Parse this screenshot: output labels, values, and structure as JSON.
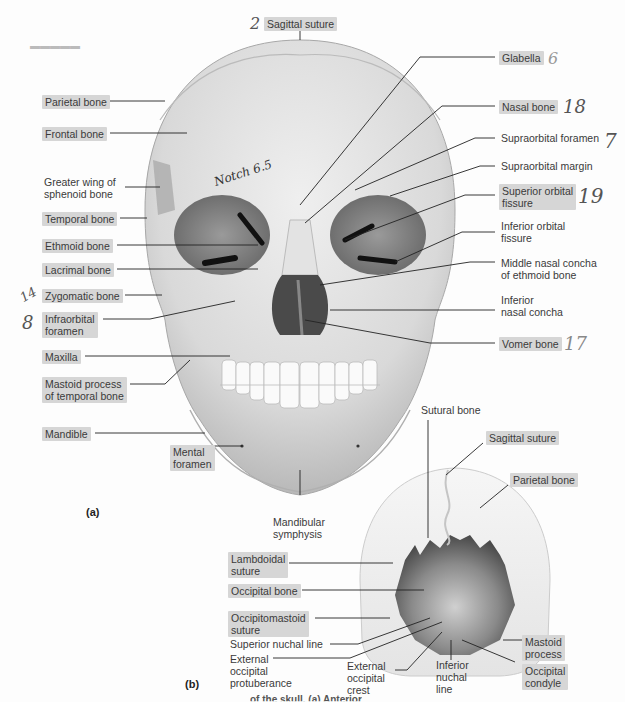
{
  "figure": {
    "panel_a": {
      "tag": "(a)",
      "labels_left": [
        {
          "text": "Parietal bone",
          "highlighted": true
        },
        {
          "text": "Frontal bone",
          "highlighted": true
        },
        {
          "text": "Greater wing of\nsphenoid bone",
          "line1": "Greater wing of",
          "line2": "sphenoid bone",
          "highlighted": false
        },
        {
          "text": "Temporal bone",
          "highlighted": true
        },
        {
          "text": "Ethmoid bone",
          "highlighted": true
        },
        {
          "text": "Lacrimal bone",
          "highlighted": true
        },
        {
          "text": "Zygomatic bone",
          "highlighted": true
        },
        {
          "text": "Infraorbital foramen",
          "line1": "Infraorbital",
          "line2": "foramen",
          "highlighted": true
        },
        {
          "text": "Maxilla",
          "highlighted": true
        },
        {
          "text": "Mastoid process of temporal bone",
          "line1": "Mastoid process",
          "line2": "of temporal bone",
          "highlighted": true
        },
        {
          "text": "Mandible",
          "highlighted": true
        },
        {
          "text": "Mental foramen",
          "line1": "Mental",
          "line2": "foramen",
          "highlighted": true
        }
      ],
      "labels_top": [
        {
          "text": "Sagittal suture",
          "highlighted": true
        }
      ],
      "labels_right": [
        {
          "text": "Glabella",
          "highlighted": true
        },
        {
          "text": "Nasal bone",
          "highlighted": true
        },
        {
          "text": "Supraorbital foramen",
          "highlighted": false
        },
        {
          "text": "Supraorbital margin",
          "highlighted": false
        },
        {
          "text": "Superior orbital fissure",
          "line1": "Superior orbital",
          "line2": "fissure",
          "highlighted": true
        },
        {
          "text": "Inferior orbital fissure",
          "line1": "Inferior orbital",
          "line2": "fissure",
          "highlighted": false
        },
        {
          "text": "Middle nasal concha of ethmoid bone",
          "line1": "Middle nasal concha",
          "line2": "of ethmoid bone",
          "highlighted": false
        },
        {
          "text": "Inferior nasal concha",
          "line1": "Inferior",
          "line2": "nasal concha",
          "highlighted": false
        },
        {
          "text": "Vomer bone",
          "highlighted": true
        }
      ],
      "labels_bottom": [
        {
          "text": "Mandibular symphysis",
          "line1": "Mandibular",
          "line2": "symphysis"
        }
      ]
    },
    "panel_b": {
      "tag": "(b)",
      "labels": [
        {
          "text": "Sutural bone",
          "highlighted": false
        },
        {
          "text": "Sagittal suture",
          "highlighted": true
        },
        {
          "text": "Parietal bone",
          "highlighted": true
        },
        {
          "text": "Lambdoidal suture",
          "line1": "Lambdoidal",
          "line2": "suture",
          "highlighted": true
        },
        {
          "text": "Occipital bone",
          "highlighted": true
        },
        {
          "text": "Occipitomastoid suture",
          "line1": "Occipitomastoid",
          "line2": "suture",
          "highlighted": true
        },
        {
          "text": "Superior nuchal line",
          "highlighted": false
        },
        {
          "text": "External occipital protuberance",
          "line1": "External",
          "line2": "occipital",
          "line3": "protuberance",
          "highlighted": false
        },
        {
          "text": "External occipital crest",
          "line1": "External",
          "line2": "occipital",
          "line3": "crest",
          "highlighted": false
        },
        {
          "text": "Inferior nuchal line",
          "line1": "Inferior",
          "line2": "nuchal",
          "line3": "line",
          "highlighted": false
        },
        {
          "text": "Mastoid process",
          "line1": "Mastoid",
          "line2": "process",
          "highlighted": true
        },
        {
          "text": "Occipital condyle",
          "line1": "Occipital",
          "line2": "condyle",
          "highlighted": true
        }
      ]
    },
    "handwritten": {
      "sagittal": "2",
      "glabella": "6",
      "nasal": "18",
      "supraorbital_foramen": "7",
      "superior_orbital": "19",
      "vomer": "17",
      "zygomatic": "14",
      "infraorbital": "8",
      "notch": "Notch 6.5"
    },
    "caption_fragment": "of the skull. (a) Anterior"
  }
}
